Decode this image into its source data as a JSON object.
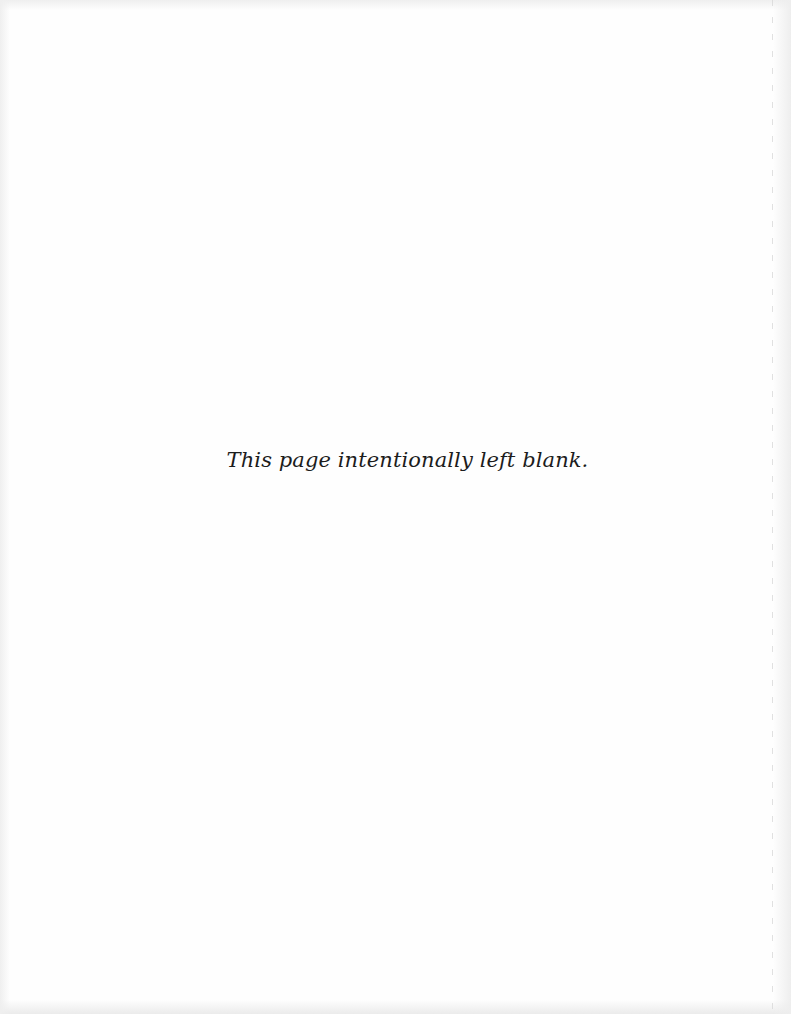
{
  "page": {
    "notice_text": "This page intentionally left blank."
  },
  "colors": {
    "background": "#fefefe",
    "text": "#1c1c1c",
    "edge_shade": "#ebebeb",
    "fold_line": "#d4d4d4"
  }
}
